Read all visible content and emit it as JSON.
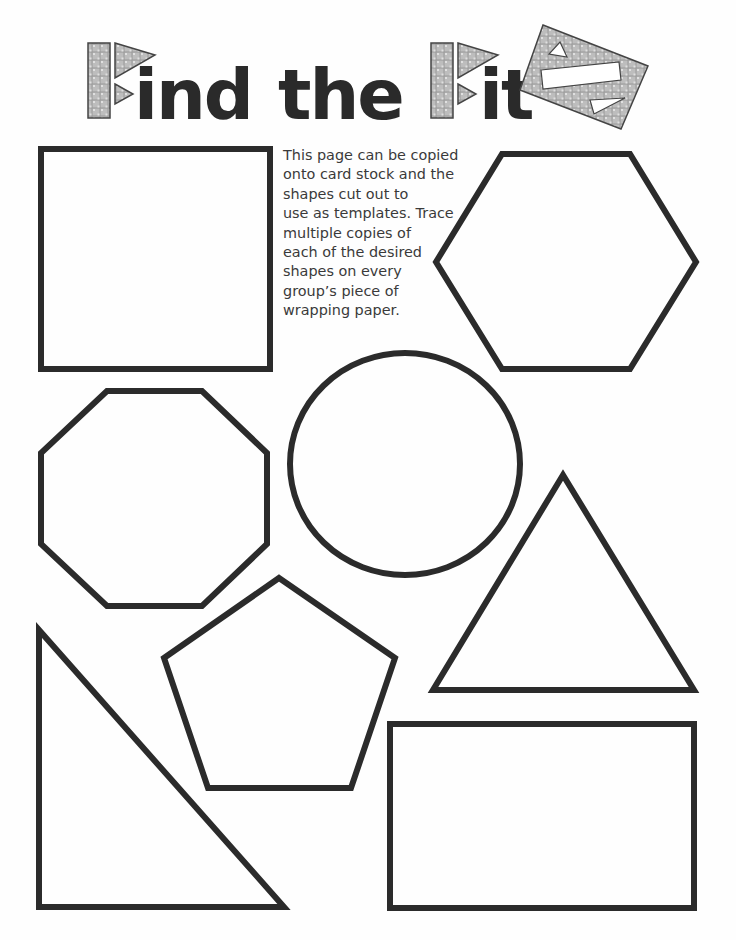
{
  "header": {
    "title_parts": {
      "first_word_rest": "ind",
      "middle_word": "the",
      "last_word_rest": "it"
    },
    "title_color": "#2a2a2a",
    "pattern_fill_color": "#b9b9b9"
  },
  "instructions": {
    "lines": [
      "This page can be copied",
      "onto card stock and the",
      "shapes cut out to",
      "use as templates. Trace",
      "multiple copies of",
      "each of the desired",
      "shapes on every",
      "group’s piece of",
      "wrapping paper."
    ]
  },
  "shapes": [
    {
      "name": "square",
      "type": "polygon",
      "points": "41,149 270,149 270,369 41,369"
    },
    {
      "name": "hexagon",
      "type": "polygon",
      "points": "502,154 630,154 696,262 630,369 502,369 436,262"
    },
    {
      "name": "octagon",
      "type": "polygon",
      "points": "107,391 202,391 267,453 267,544 202,606 107,606 41,544 41,453"
    },
    {
      "name": "circle",
      "type": "ellipse",
      "cx": 405,
      "cy": 464,
      "rx": 115,
      "ry": 111
    },
    {
      "name": "triangle",
      "type": "polygon",
      "points": "563,475 433,690 694,690"
    },
    {
      "name": "pentagon",
      "type": "polygon",
      "points": "279,578 395,658 351,788 208,788 164,658"
    },
    {
      "name": "right-triangle",
      "type": "polygon",
      "points": "39,630 39,907 284,907"
    },
    {
      "name": "rectangle",
      "type": "polygon",
      "points": "390,724 694,724 694,908 390,908"
    }
  ],
  "stroke_color": "#2b2b2b"
}
